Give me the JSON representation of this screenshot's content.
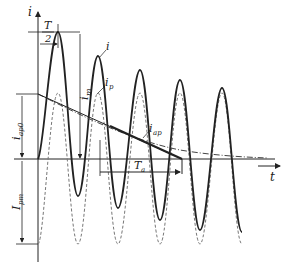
{
  "diagram": {
    "type": "short-circuit current waveform",
    "axes": {
      "y_label": "i",
      "x_label": "t"
    },
    "labels": {
      "half_period_num": "T",
      "half_period_den": "2",
      "total_current": "i",
      "periodic_component": "i",
      "periodic_sub": "p",
      "aperiodic_component": "i",
      "aperiodic_sub": "ap",
      "peak_current": "i",
      "peak_sub": "m",
      "initial_aperiodic": "i",
      "initial_aperiodic_sub": "ap0",
      "periodic_amplitude": "I",
      "periodic_amplitude_sub": "pm",
      "time_constant": "T",
      "time_constant_sub": "a"
    },
    "colors": {
      "line": "#222222",
      "dashed": "#777777"
    }
  }
}
